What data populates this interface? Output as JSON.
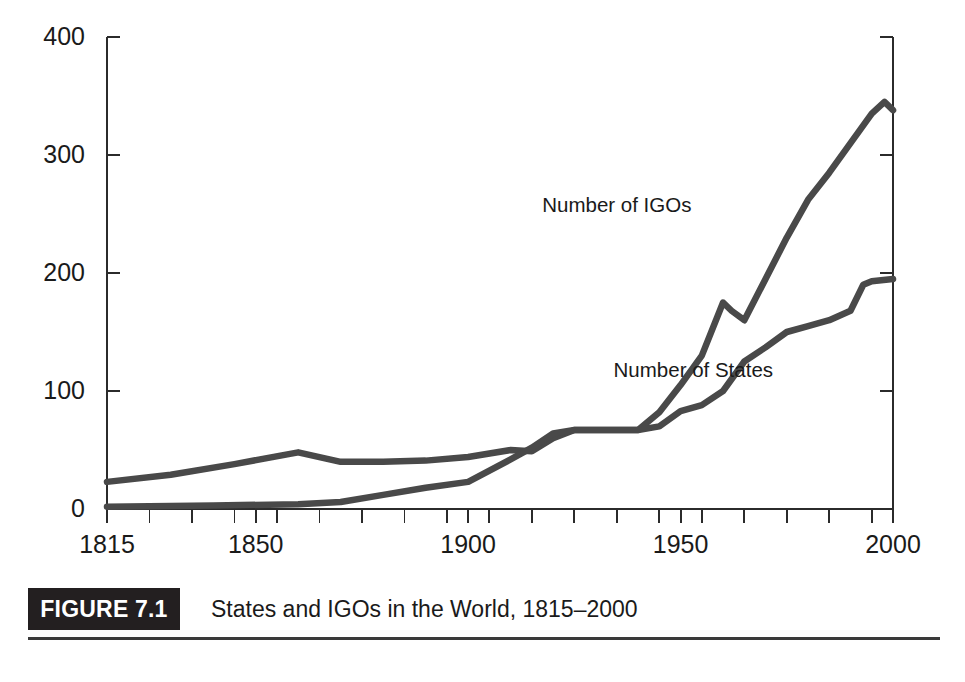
{
  "figure": {
    "tag": "FIGURE 7.1",
    "caption": "States and IGOs in the World, 1815–2000"
  },
  "chart_data": {
    "type": "line",
    "title": "States and IGOs in the World, 1815–2000",
    "xlabel": "",
    "ylabel": "",
    "xlim": [
      1815,
      2000
    ],
    "ylim": [
      0,
      400
    ],
    "yticks": [
      0,
      100,
      200,
      300,
      400
    ],
    "ytick_labels": [
      "0",
      "100",
      "200",
      "300",
      "400"
    ],
    "xticks": [
      1815,
      1850,
      1900,
      1950,
      2000
    ],
    "xtick_labels": [
      "1815",
      "1850",
      "1900",
      "1950",
      "2000"
    ],
    "xminor_step": 10,
    "grid": false,
    "legend_position": "inline-annotation",
    "line_color": "#494949",
    "axis_color": "#2b2b2b",
    "series": [
      {
        "name": "Number of IGOs",
        "label_x": 1935,
        "label_y": 252,
        "x": [
          1815,
          1830,
          1845,
          1860,
          1870,
          1880,
          1890,
          1900,
          1910,
          1915,
          1920,
          1925,
          1930,
          1940,
          1945,
          1950,
          1955,
          1960,
          1962,
          1965,
          1970,
          1975,
          1980,
          1985,
          1990,
          1995,
          1998,
          2000
        ],
        "values": [
          23,
          29,
          38,
          48,
          40,
          40,
          41,
          44,
          50,
          49,
          60,
          67,
          67,
          67,
          82,
          105,
          130,
          175,
          168,
          160,
          195,
          230,
          262,
          285,
          310,
          335,
          345,
          338
        ]
      },
      {
        "name": "Number of States",
        "label_x": 1953,
        "label_y": 112,
        "x": [
          1815,
          1840,
          1860,
          1870,
          1880,
          1890,
          1900,
          1910,
          1915,
          1920,
          1925,
          1930,
          1940,
          1945,
          1950,
          1955,
          1960,
          1965,
          1970,
          1975,
          1980,
          1985,
          1990,
          1993,
          1995,
          2000
        ],
        "values": [
          2,
          3,
          4,
          6,
          12,
          18,
          23,
          42,
          52,
          64,
          67,
          67,
          67,
          70,
          83,
          88,
          100,
          125,
          137,
          150,
          155,
          160,
          168,
          190,
          193,
          195
        ]
      }
    ]
  }
}
